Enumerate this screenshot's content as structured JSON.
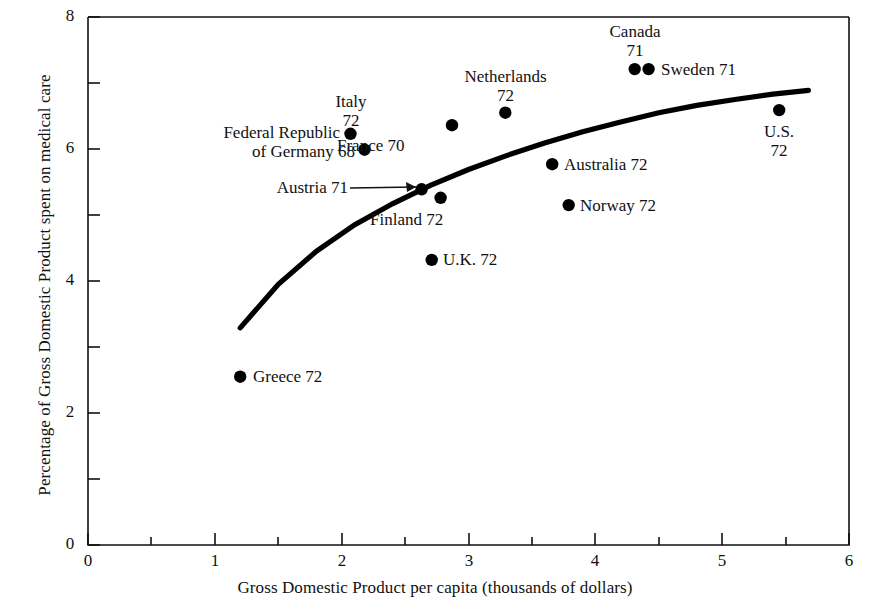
{
  "chart_data": {
    "type": "scatter",
    "title": "",
    "xlabel": "Gross Domestic Product per capita (thousands of dollars)",
    "ylabel": "Percentage of Gross Domestic Product spent on medical care",
    "xlim": [
      0,
      6
    ],
    "ylim": [
      0,
      8
    ],
    "xticks": [
      "0",
      "1",
      "2",
      "3",
      "4",
      "5",
      "6"
    ],
    "yticks": [
      "0",
      "2",
      "4",
      "6",
      "8"
    ],
    "x_minor_step": 0.5,
    "y_minor_step": 1,
    "grid": false,
    "legend": "none",
    "marker_color": "#000000",
    "line_color": "#000000",
    "points": [
      {
        "name": "Greece",
        "year": "72",
        "x": 1.2,
        "y": 2.55,
        "label": "Greece 72",
        "label_pos": "right"
      },
      {
        "name": "Italy",
        "year": "72",
        "x": 2.07,
        "y": 6.23,
        "label": "Italy\n72",
        "label_pos": "above"
      },
      {
        "name": "Federal Republic of Germany",
        "year": "68",
        "x": 2.18,
        "y": 5.99,
        "label": "Federal Republic\nof Germany 68",
        "label_pos": "left"
      },
      {
        "name": "Austria",
        "year": "71",
        "x": 2.63,
        "y": 5.39,
        "label": "Austria 71",
        "label_pos": "leader-left"
      },
      {
        "name": "U.K.",
        "year": "72",
        "x": 2.71,
        "y": 4.32,
        "label": "U.K. 72",
        "label_pos": "right"
      },
      {
        "name": "Finland",
        "year": "72",
        "x": 2.78,
        "y": 5.26,
        "label": "Finland 72",
        "label_pos": "below-left"
      },
      {
        "name": "France",
        "year": "70",
        "x": 2.87,
        "y": 6.36,
        "label": "France 70",
        "label_pos": "below-left"
      },
      {
        "name": "Netherlands",
        "year": "72",
        "x": 3.29,
        "y": 6.55,
        "label": "Netherlands\n72",
        "label_pos": "above"
      },
      {
        "name": "Australia",
        "year": "72",
        "x": 3.66,
        "y": 5.77,
        "label": "Australia 72",
        "label_pos": "right"
      },
      {
        "name": "Norway",
        "year": "72",
        "x": 3.79,
        "y": 5.15,
        "label": "Norway 72",
        "label_pos": "right"
      },
      {
        "name": "Canada",
        "year": "71",
        "x": 4.31,
        "y": 7.21,
        "label": "Canada\n71",
        "label_pos": "above"
      },
      {
        "name": "Sweden",
        "year": "71",
        "x": 4.42,
        "y": 7.21,
        "label": "Sweden 71",
        "label_pos": "right"
      },
      {
        "name": "U.S.",
        "year": "72",
        "x": 5.45,
        "y": 6.59,
        "label": "U.S.\n72",
        "label_pos": "below"
      }
    ],
    "fit_curve": {
      "description": "smooth concave trend line",
      "x_start": 1.2,
      "y_start": 3.29,
      "x_end": 5.68,
      "y_end": 6.89,
      "samples": [
        [
          1.2,
          3.29
        ],
        [
          1.5,
          3.95
        ],
        [
          1.8,
          4.45
        ],
        [
          2.1,
          4.85
        ],
        [
          2.4,
          5.17
        ],
        [
          2.7,
          5.45
        ],
        [
          3.0,
          5.69
        ],
        [
          3.3,
          5.9
        ],
        [
          3.6,
          6.09
        ],
        [
          3.9,
          6.26
        ],
        [
          4.2,
          6.41
        ],
        [
          4.5,
          6.55
        ],
        [
          4.8,
          6.66
        ],
        [
          5.1,
          6.75
        ],
        [
          5.4,
          6.83
        ],
        [
          5.68,
          6.89
        ]
      ]
    }
  },
  "labels": {
    "greece": "Greece 72",
    "italy_line1": "Italy",
    "italy_line2": "72",
    "germany_line1": "Federal Republic",
    "germany_line2": "of Germany 68",
    "austria": "Austria 71",
    "uk": "U.K. 72",
    "finland": "Finland 72",
    "france": "France 70",
    "netherlands_line1": "Netherlands",
    "netherlands_line2": "72",
    "australia": "Australia 72",
    "norway": "Norway 72",
    "canada_line1": "Canada",
    "canada_line2": "71",
    "sweden": "Sweden 71",
    "us_line1": "U.S.",
    "us_line2": "72"
  },
  "ticks": {
    "x0": "0",
    "x1": "1",
    "x2": "2",
    "x3": "3",
    "x4": "4",
    "x5": "5",
    "x6": "6",
    "y0": "0",
    "y2": "2",
    "y4": "4",
    "y6": "6",
    "y8": "8"
  }
}
